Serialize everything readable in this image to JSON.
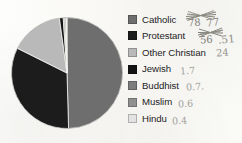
{
  "chart_data": {
    "type": "pie",
    "title": "",
    "subtitle": "",
    "xlabel": "",
    "ylabel": "",
    "legend_position": "right",
    "grid": false,
    "units": "millions of adherents",
    "categories": [
      "Catholic",
      "Protestant",
      "Other Christian",
      "Jewish",
      "Buddhist",
      "Muslim",
      "Hindu"
    ],
    "values": [
      77,
      51,
      24,
      1.7,
      0.7,
      0.6,
      0.4
    ],
    "colors": [
      "#6e6e6e",
      "#1c1c1c",
      "#b9b9b9",
      "#141414",
      "#7d7d7d",
      "#909090",
      "#e2e2e2"
    ],
    "annotations": [
      {
        "category": "Catholic",
        "text": "77",
        "struck_out": true,
        "struck_text": "78"
      },
      {
        "category": "Protestant",
        "text": ".51",
        "struck_out": true,
        "struck_text": "56"
      },
      {
        "category": "Other Christian",
        "text": "24",
        "struck_out": false
      },
      {
        "category": "Jewish",
        "text": "1.7",
        "struck_out": false
      },
      {
        "category": "Buddhist",
        "text": "0.7.",
        "struck_out": false
      },
      {
        "category": "Muslim",
        "text": "0.6",
        "struck_out": false
      },
      {
        "category": "Hindu",
        "text": "0.4",
        "struck_out": false
      }
    ]
  },
  "legend": {
    "items": [
      {
        "label": "Catholic",
        "color": "#6e6e6e",
        "annotation": "77",
        "struck": true
      },
      {
        "label": "Protestant",
        "color": "#1c1c1c",
        "annotation": ".51",
        "struck": true
      },
      {
        "label": "Other Christian",
        "color": "#b9b9b9",
        "annotation": "24",
        "struck": false
      },
      {
        "label": "Jewish",
        "color": "#141414",
        "annotation": "1.7",
        "struck": false
      },
      {
        "label": "Buddhist",
        "color": "#7d7d7d",
        "annotation": "0.7.",
        "struck": false
      },
      {
        "label": "Muslim",
        "color": "#909090",
        "annotation": "0.6",
        "struck": false
      },
      {
        "label": "Hindu",
        "color": "#e2e2e2",
        "annotation": "0.4",
        "struck": false
      }
    ]
  },
  "struck_values": {
    "catholic": "78",
    "protestant": "56"
  }
}
